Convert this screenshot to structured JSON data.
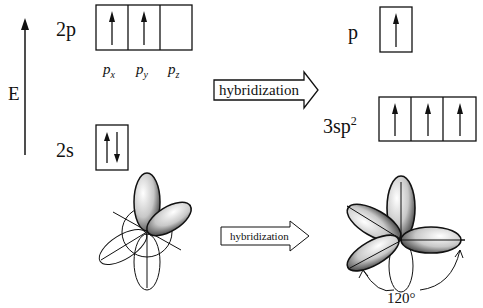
{
  "energy_axis": {
    "label": "E"
  },
  "left_levels": {
    "2p": {
      "label": "2p",
      "orbitals": [
        "p",
        "p",
        "p"
      ],
      "subscripts": [
        "x",
        "y",
        "z"
      ],
      "electrons": [
        "up",
        "up",
        "empty"
      ]
    },
    "2s": {
      "label": "2s",
      "electrons": [
        "up-down"
      ]
    }
  },
  "right_levels": {
    "p": {
      "label": "p",
      "electrons": [
        "up"
      ]
    },
    "sp2": {
      "label": "3sp",
      "superscript": "2",
      "electrons": [
        "up",
        "up",
        "up"
      ]
    }
  },
  "arrows": {
    "top": {
      "label": "hybridization"
    },
    "bottom": {
      "label": "hybridization"
    }
  },
  "angle_annotation": {
    "value": "120",
    "unit": "°"
  }
}
